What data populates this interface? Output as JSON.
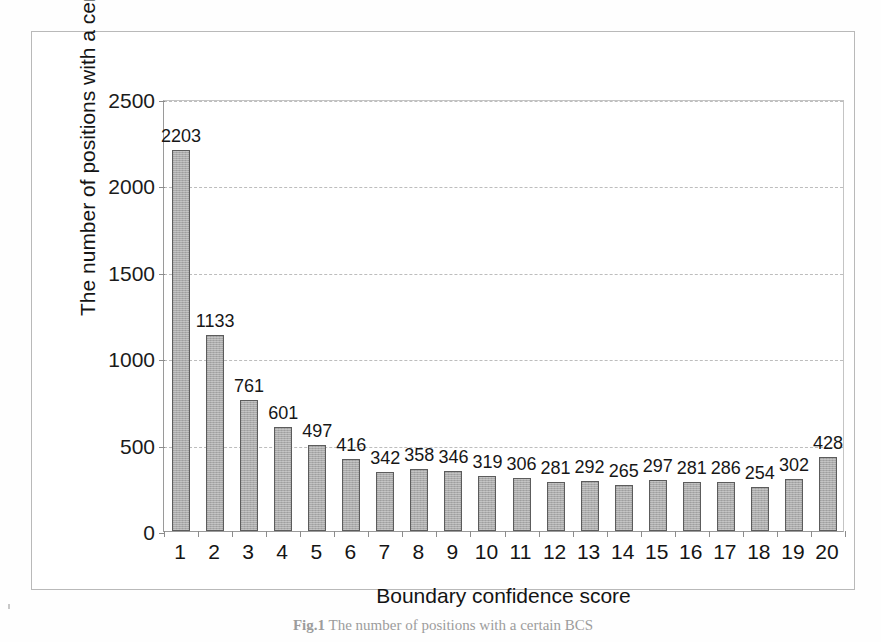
{
  "chart_data": {
    "type": "bar",
    "title": "",
    "xlabel": "Boundary confidence score",
    "ylabel": "The number of positions with a certain BCS",
    "categories": [
      "1",
      "2",
      "3",
      "4",
      "5",
      "6",
      "7",
      "8",
      "9",
      "10",
      "11",
      "12",
      "13",
      "14",
      "15",
      "16",
      "17",
      "18",
      "19",
      "20"
    ],
    "values": [
      2203,
      1133,
      761,
      601,
      497,
      416,
      342,
      358,
      346,
      319,
      306,
      281,
      292,
      265,
      297,
      281,
      286,
      254,
      302,
      428
    ],
    "data_labels": [
      "2203",
      "1133",
      "761",
      "601",
      "497",
      "416",
      "342",
      "358",
      "346",
      "319",
      "306",
      "281",
      "292",
      "265",
      "297",
      "281",
      "286",
      "254",
      "302",
      "428"
    ],
    "ylim": [
      0,
      2500
    ],
    "y_ticks": [
      0,
      500,
      1000,
      1500,
      2000,
      2500
    ],
    "y_tick_labels": [
      "0",
      "500",
      "1000",
      "1500",
      "2000",
      "2500"
    ],
    "grid": "horizontal-dashed",
    "legend": "none",
    "bar_color": "#ababab",
    "bar_border_color": "#5c5c5c",
    "gridline_color": "#bdbdbd",
    "axis_color": "#9a9a9a",
    "text_color": "#141414"
  },
  "figure": {
    "caption_label": "Fig.1",
    "caption_text": "The number of positions with a certain BCS"
  }
}
